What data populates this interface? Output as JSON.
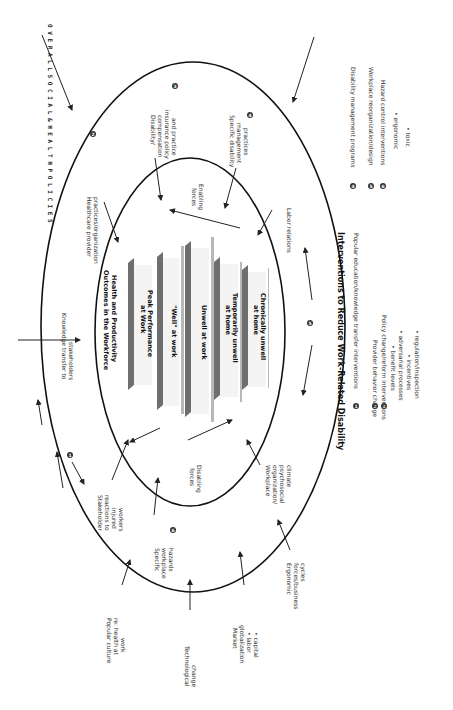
{
  "diagram": {
    "orientation": "rotated 90deg clockwise",
    "outer_banner": "O V E R A L L   S O C I A L  &  H E A L T H   P O L I C I E S",
    "center": {
      "title_line1": "Health and Productivity",
      "title_line2": "Outcomes in the Workforce",
      "outcomes": [
        {
          "line1": "Peak Performance",
          "line2": "at Work"
        },
        {
          "line1": "\"Well\" at work",
          "line2": ""
        },
        {
          "line1": "Unwell at work",
          "line2": ""
        },
        {
          "line1": "Temporarily unwell",
          "line2": "at home"
        },
        {
          "line1": "Chronically unwell",
          "line2": "at home"
        }
      ]
    },
    "inner_ring_labels": {
      "enabling_forces": [
        "Enabling",
        "forces"
      ],
      "disabling_forces": [
        "Disabling",
        "forces"
      ]
    },
    "middle_ring_labels": {
      "disability_compensation": [
        "Disability/",
        "compensation",
        "insurance policy",
        "and practice"
      ],
      "specific_disability_mgmt": [
        "Specific disability",
        "management",
        "practices"
      ],
      "healthcare_provider": [
        "Healthcare provider",
        "practices/organization"
      ],
      "labor_relations": [
        "Labor  relations"
      ],
      "knowledge_transfer": [
        "Knowledge transfer  to",
        "stakeholders"
      ],
      "stakeholder_reactions": [
        "Stakeholder",
        "reactions to",
        "injured",
        "workers"
      ],
      "specific_workplace_hazards": [
        "Specific",
        "workplace",
        "hazards"
      ],
      "workplace_org": [
        "Workplace",
        "organization/",
        "psychosocial",
        "climate"
      ]
    },
    "outer_labels": {
      "popular_culture": [
        "Popular culture",
        "re: health at",
        "work"
      ],
      "technological_change": [
        "Technological",
        "change"
      ],
      "market_globalization": [
        "Market",
        "globalization",
        "• labor",
        "• capital"
      ],
      "ergonomic_forces": [
        "Ergonomic",
        "forces/business",
        "cycles"
      ]
    },
    "badges": {
      "b1": "1",
      "b2": "2",
      "b3": "3",
      "b4": "4",
      "b5": "5",
      "b6": "6"
    }
  },
  "legend": {
    "title": "Interventions to Reduce Work-Related Disability",
    "items": [
      {
        "num": "1",
        "text": "Popular education/knowledge transfer interventions"
      },
      {
        "num": "2",
        "text": "Provider behavior change"
      },
      {
        "num": "3",
        "text": "Policy change/reform interventions"
      },
      {
        "num": "",
        "text": "• benefit levels"
      },
      {
        "num": "",
        "text": "• adversarial processes"
      },
      {
        "num": "",
        "text": "• incentives"
      },
      {
        "num": "",
        "text": "• regulation/inspection"
      },
      {
        "num": "4",
        "text": "Disability management programs"
      },
      {
        "num": "5",
        "text": "Workplace reorganization/design"
      },
      {
        "num": "6",
        "text": "Hazard control interventions"
      },
      {
        "num": "",
        "text": "•   ergonomic"
      },
      {
        "num": "",
        "text": "•   toxic"
      }
    ]
  },
  "colors": {
    "ring": "#111111",
    "bar_dark": "#6e6e6e",
    "bar_light": "#b8b8b8",
    "badge": "#333333"
  }
}
